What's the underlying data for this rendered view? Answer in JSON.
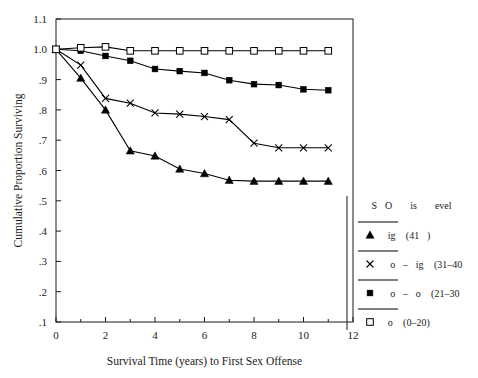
{
  "chart_data": {
    "type": "line",
    "title": "",
    "xlabel": "Survival Time (years) to First Sex Offense",
    "ylabel": "Cumulative Proportion Surviving",
    "xlim": [
      0,
      12
    ],
    "ylim": [
      0.1,
      1.1
    ],
    "xticks": [
      "0",
      "2",
      "4",
      "6",
      "8",
      "10",
      "12"
    ],
    "xtick_values": [
      0,
      2,
      4,
      6,
      8,
      10,
      12
    ],
    "xtick_minor_values": [
      1,
      3,
      5,
      7,
      9,
      11
    ],
    "yticks": [
      "1.1",
      "1.0",
      ".9",
      ".8",
      ".7",
      ".6",
      ".5",
      ".4",
      ".3",
      ".2",
      ".1"
    ],
    "ytick_values": [
      1.1,
      1.0,
      0.9,
      0.8,
      0.7,
      0.6,
      0.5,
      0.4,
      0.3,
      0.2,
      0.1
    ],
    "grid": false,
    "legend_position": "right",
    "legend_title": "SO is evel",
    "x": [
      0,
      1,
      2,
      3,
      4,
      5,
      6,
      7,
      8,
      9,
      10,
      11
    ],
    "series": [
      {
        "name": "ig (41)",
        "marker": "filled-triangle",
        "values": [
          1.0,
          0.905,
          0.8,
          0.665,
          0.648,
          0.605,
          0.59,
          0.568,
          0.565,
          0.565,
          0.565,
          0.565
        ]
      },
      {
        "name": "o–ig (31–40",
        "marker": "cross",
        "values": [
          1.0,
          0.948,
          0.838,
          0.822,
          0.79,
          0.786,
          0.778,
          0.768,
          0.69,
          0.675,
          0.675,
          0.675
        ]
      },
      {
        "name": " o–o (21–30",
        "marker": "filled-square",
        "values": [
          1.0,
          0.995,
          0.978,
          0.962,
          0.935,
          0.928,
          0.922,
          0.898,
          0.885,
          0.882,
          0.868,
          0.865
        ]
      },
      {
        "name": "o  (0–20)",
        "marker": "open-square",
        "values": [
          1.0,
          1.005,
          1.008,
          0.995,
          0.995,
          0.995,
          0.995,
          0.995,
          0.995,
          0.995,
          0.995,
          0.995
        ]
      }
    ]
  },
  "legend": {
    "title": "SO is evel",
    "entries": [
      {
        "label": "ig (41)",
        "marker": "filled-triangle"
      },
      {
        "label": " o–ig (31–40",
        "marker": "cross"
      },
      {
        "label": " o–o (21–30",
        "marker": "filled-square"
      },
      {
        "label": "o  (0–20)",
        "marker": "open-square"
      }
    ]
  },
  "axes": {
    "ylabel": "Cumulative Proportion Surviving",
    "xlabel": "Survival Time (years) to First Sex Offense",
    "ytick_labels": [
      "1.1",
      "1.0",
      ".9",
      ".8",
      ".7",
      ".6",
      ".5",
      ".4",
      ".3",
      ".2",
      ".1"
    ],
    "xtick_labels": [
      "0",
      "2",
      "4",
      "6",
      "8",
      "10",
      "12"
    ]
  },
  "colors": {
    "line": "#000000",
    "axis": "#1a1a1a",
    "background": "#ffffff",
    "text": "#1a1a1a"
  }
}
